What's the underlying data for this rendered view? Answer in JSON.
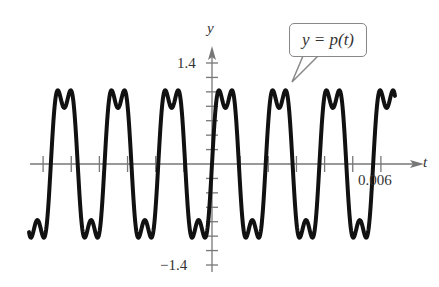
{
  "chart_data": {
    "type": "line",
    "title": "",
    "xlabel": "t",
    "ylabel": "y",
    "annotation": "y = p(t)",
    "y_ticks_labeled": [
      1.4,
      -1.4
    ],
    "y_tick_step": 0.2,
    "x_tick_labeled": 0.006,
    "x_tick_step": 0.001,
    "xlim": [
      -0.0065,
      0.0066
    ],
    "ylim": [
      -1.4,
      1.4
    ],
    "grid": false,
    "function": {
      "description": "periodic square-like wave: A*(sin(2*pi*f*t) + k*sin(3*2*pi*f*t))",
      "amplitude": 1.11,
      "harmonic3_ratio": 0.3,
      "frequency_hz": 524,
      "t_range": [
        -0.0065,
        0.0065
      ]
    },
    "series": [
      {
        "name": "y = p(t)",
        "color": "#111111"
      }
    ]
  },
  "labels": {
    "y_axis": "y",
    "t_axis": "t",
    "y_top": "1.4",
    "y_bottom": "−1.4",
    "x_right": "0.006",
    "callout": "y = p(t)"
  }
}
